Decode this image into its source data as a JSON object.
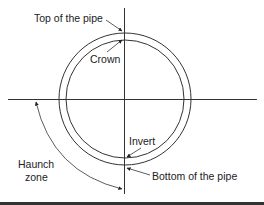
{
  "diagram": {
    "type": "pipe-cross-section",
    "labels": {
      "top": "Top of the pipe",
      "crown": "Crown",
      "invert": "Invert",
      "bottom": "Bottom of the pipe",
      "haunch_line1": "Haunch",
      "haunch_line2": "zone"
    },
    "colors": {
      "stroke": "#333333",
      "text": "#222222",
      "background": "#ffffff"
    }
  }
}
